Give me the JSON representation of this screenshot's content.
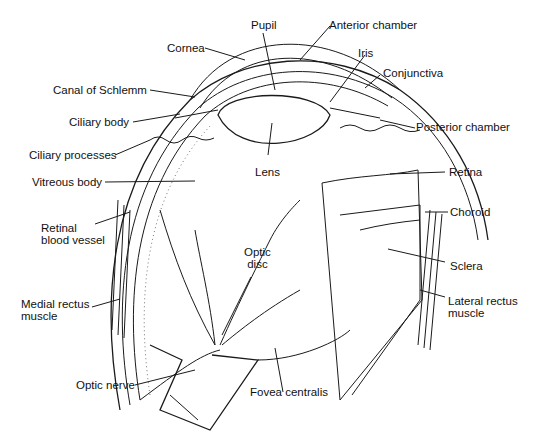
{
  "figure": {
    "background": "#ffffff",
    "line_color": "#1a1a1a"
  },
  "labels": {
    "pupil": "Pupil",
    "anterior_chamber": "Anterior chamber",
    "cornea": "Cornea",
    "iris": "Iris",
    "conjunctiva": "Conjunctiva",
    "canal_of_schlemm": "Canal of Schlemm",
    "ciliary_body": "Ciliary body",
    "posterior_chamber": "Posterior chamber",
    "ciliary_processes": "Ciliary processes",
    "lens": "Lens",
    "vitreous_body": "Vitreous body",
    "retina": "Retina",
    "retinal_blood_vessel": "Retinal\nblood vessel",
    "choroid": "Choroid",
    "optic_disc": "Optic\ndisc",
    "sclera": "Sclera",
    "medial_rectus_muscle": "Medial rectus\nmuscle",
    "lateral_rectus_muscle": "Lateral rectus\nmuscle",
    "optic_nerve": "Optic nerve",
    "fovea_centralis": "Fovea centralis"
  }
}
